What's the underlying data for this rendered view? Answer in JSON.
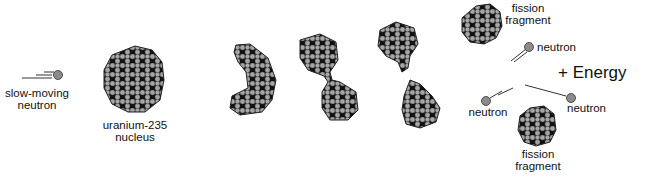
{
  "diagram": {
    "colors": {
      "proton": "#a6a6a6",
      "neutron_in_nucleus": "#111111",
      "free_neutron": "#8c8c8c",
      "outline": "#333333",
      "background": "#ffffff"
    },
    "stages": [
      {
        "id": "incoming",
        "label": "slow-moving neutron"
      },
      {
        "id": "target",
        "label": "uranium-235 nucleus"
      },
      {
        "id": "elongating",
        "label": ""
      },
      {
        "id": "necking",
        "label": ""
      },
      {
        "id": "splitting",
        "label": ""
      },
      {
        "id": "products",
        "label": "fission fragments + neutrons + energy"
      }
    ],
    "labels": {
      "slow_neutron_line1": "slow-moving",
      "slow_neutron_line2": "neutron",
      "nucleus_line1": "uranium-235",
      "nucleus_line2": "nucleus",
      "fragment_top_line1": "fission",
      "fragment_top_line2": "fragment",
      "fragment_bottom_line1": "fission",
      "fragment_bottom_line2": "fragment",
      "neutron_top": "neutron",
      "neutron_left": "neutron",
      "neutron_right": "neutron",
      "energy": "+ Energy"
    }
  }
}
